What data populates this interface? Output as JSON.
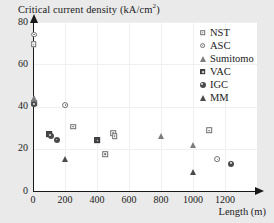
{
  "figure": {
    "title_text": "Critical current density (kA/cm",
    "title_sup": "2",
    "title_tail": ")",
    "background_color": "#eaeaea",
    "plot_background_color": "#ffffff",
    "axis_color": "#1a1a1a",
    "gridline_color": "#f0f0f0"
  },
  "legend": {
    "entries": [
      {
        "label": "NST",
        "marker": "square-open",
        "marker_name": "legend-marker-nst"
      },
      {
        "label": "ASC",
        "marker": "circle-open",
        "marker_name": "legend-marker-asc"
      },
      {
        "label": "Sumitomo",
        "marker": "triangle-open",
        "marker_name": "legend-marker-sumitomo"
      },
      {
        "label": "VAC",
        "marker": "square-filled",
        "marker_name": "legend-marker-vac"
      },
      {
        "label": "IGC",
        "marker": "circle-filled",
        "marker_name": "legend-marker-igc"
      },
      {
        "label": "MM",
        "marker": "triangle-filled",
        "marker_name": "legend-marker-mm"
      }
    ]
  },
  "axes": {
    "x_label": "Length (m)",
    "x_ticks": [
      0,
      200,
      400,
      600,
      800,
      1000,
      1200
    ],
    "x_tick_labels": [
      "0",
      "200",
      "400",
      "600",
      "800",
      "1000",
      "1200"
    ],
    "y_ticks": [
      0,
      20,
      40,
      60,
      80
    ],
    "y_tick_labels": [
      "0",
      "20",
      "40",
      "60",
      "80"
    ]
  },
  "chart_data": {
    "type": "scatter",
    "title": "Critical current density (kA/cm2)",
    "xlabel": "Length (m)",
    "ylabel": "Critical current density (kA/cm2)",
    "xlim": [
      0,
      1400
    ],
    "ylim": [
      0,
      80
    ],
    "xticks": [
      0,
      200,
      400,
      600,
      800,
      1000,
      1200
    ],
    "yticks": [
      0,
      20,
      40,
      60,
      80
    ],
    "grid": true,
    "legend_position": "upper right",
    "series": [
      {
        "name": "NST",
        "marker": "square-open",
        "points": [
          {
            "x": 5,
            "y": 69.5
          },
          {
            "x": 8,
            "y": 41.5
          },
          {
            "x": 250,
            "y": 30.5
          },
          {
            "x": 450,
            "y": 17.5
          },
          {
            "x": 500,
            "y": 27.5
          },
          {
            "x": 510,
            "y": 26.0
          },
          {
            "x": 1100,
            "y": 28.8
          }
        ]
      },
      {
        "name": "ASC",
        "marker": "circle-open",
        "points": [
          {
            "x": 5,
            "y": 74.0
          },
          {
            "x": 8,
            "y": 42.0
          },
          {
            "x": 200,
            "y": 40.8
          },
          {
            "x": 1150,
            "y": 15.0
          }
        ]
      },
      {
        "name": "Sumitomo",
        "marker": "triangle-open",
        "points": [
          {
            "x": 8,
            "y": 43.8
          },
          {
            "x": 800,
            "y": 26.2
          },
          {
            "x": 1000,
            "y": 22.0
          }
        ]
      },
      {
        "name": "VAC",
        "marker": "square-filled",
        "points": [
          {
            "x": 100,
            "y": 27.0
          },
          {
            "x": 400,
            "y": 24.0
          }
        ]
      },
      {
        "name": "IGC",
        "marker": "circle-filled",
        "points": [
          {
            "x": 8,
            "y": 41.0
          },
          {
            "x": 110,
            "y": 26.2
          },
          {
            "x": 150,
            "y": 24.2
          },
          {
            "x": 1240,
            "y": 13.0
          }
        ]
      },
      {
        "name": "MM",
        "marker": "triangle-filled",
        "points": [
          {
            "x": 200,
            "y": 15.2
          },
          {
            "x": 1000,
            "y": 9.0
          }
        ]
      }
    ]
  }
}
